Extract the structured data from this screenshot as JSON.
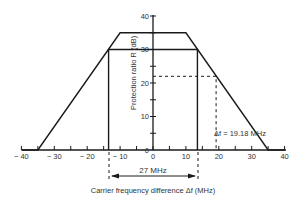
{
  "chart_data": {
    "type": "line",
    "title": "",
    "xlabel": "Carrier frequency difference Δf (MHz)",
    "ylabel": "Protection ratio R (dB)",
    "xlim": [
      -40,
      40
    ],
    "ylim": [
      0,
      40
    ],
    "x_ticks": [
      -40,
      -30,
      -20,
      -10,
      0,
      10,
      20,
      30,
      40
    ],
    "x_tick_labels": [
      "− 40",
      "− 30",
      "− 20",
      "− 10",
      "0",
      "10",
      "20",
      "30",
      "40"
    ],
    "y_ticks": [
      0,
      10,
      20,
      30,
      40
    ],
    "y_tick_labels": [
      "0",
      "10",
      "20",
      "30",
      "40"
    ],
    "grid": false,
    "series": [
      {
        "name": "Protection ratio mask (outer)",
        "x": [
          -40,
          -35,
          -10,
          10,
          35,
          40
        ],
        "y": [
          0,
          0,
          35,
          35,
          0,
          0
        ]
      },
      {
        "name": "Inner 30 dB bandwidth",
        "x": [
          -13.5,
          -13.5,
          13.5,
          13.5
        ],
        "y": [
          0,
          30,
          30,
          0
        ]
      },
      {
        "name": "Dashed marker",
        "style": "dashed",
        "x": [
          0,
          19.18,
          19.18
        ],
        "y": [
          22,
          22,
          0
        ]
      }
    ],
    "annotations": [
      {
        "text": "Δf = 19.18 MHz",
        "x": 19.18,
        "y": 5
      },
      {
        "text": "27 MHz",
        "from_x": -13.5,
        "to_x": 13.5,
        "position": "below axis"
      }
    ]
  },
  "labels": {
    "x_axis": "Carrier frequency difference Δf (MHz)",
    "y_axis": "Protection ratio  R  (dB)",
    "delta_f": "Δf =  19.18 MHz",
    "bandwidth": "27 MHz"
  }
}
